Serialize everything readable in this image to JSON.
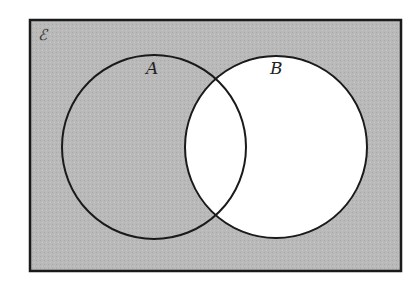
{
  "diagram": {
    "type": "venn",
    "universal_label": "ℰ",
    "sets": [
      {
        "name": "A",
        "label": "A",
        "cx": 154,
        "cy": 147,
        "r": 92
      },
      {
        "name": "B",
        "label": "B",
        "cx": 276,
        "cy": 147,
        "r": 91
      }
    ],
    "shaded_region": "B'",
    "colors": {
      "shade": "#b9b9b9",
      "unshaded": "#ffffff",
      "stroke": "#1a1a1a"
    }
  }
}
